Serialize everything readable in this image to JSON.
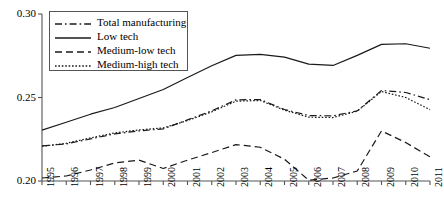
{
  "chart_data": {
    "type": "line",
    "title": "",
    "subtitle": "",
    "xlabel": "",
    "ylabel": "",
    "x": [
      1995,
      1996,
      1997,
      1998,
      1999,
      2000,
      2001,
      2002,
      2003,
      2004,
      2005,
      2006,
      2007,
      2008,
      2009,
      2010,
      2011
    ],
    "categories": [
      "1995",
      "1996",
      "1997",
      "1998",
      "1999",
      "2000",
      "2001",
      "2002",
      "2003",
      "2004",
      "2005",
      "2006",
      "2007",
      "2008",
      "2009",
      "2010",
      "2011"
    ],
    "xlim": [
      1995,
      2011
    ],
    "ylim": [
      0.2,
      0.3
    ],
    "yticks": [
      0.2,
      0.25,
      0.3
    ],
    "ytick_labels": [
      "0.20",
      "0.25",
      "0.30"
    ],
    "grid": false,
    "legend_position": "upper-left",
    "series": [
      {
        "name": "Total manufacturing",
        "style": "dash-dot",
        "color": "#1a1a1a",
        "values": [
          0.221,
          0.2222,
          0.2252,
          0.2282,
          0.23,
          0.2312,
          0.2366,
          0.242,
          0.2486,
          0.2488,
          0.2428,
          0.2392,
          0.239,
          0.242,
          0.2542,
          0.253,
          0.2487
        ]
      },
      {
        "name": "Low tech",
        "style": "solid",
        "color": "#1a1a1a",
        "values": [
          0.2305,
          0.2352,
          0.24,
          0.244,
          0.2494,
          0.2548,
          0.262,
          0.269,
          0.2752,
          0.2758,
          0.2742,
          0.27,
          0.2692,
          0.2752,
          0.2818,
          0.2822,
          0.2795
        ]
      },
      {
        "name": "Medium-low tech",
        "style": "dashed",
        "color": "#1a1a1a",
        "values": [
          0.2018,
          0.203,
          0.2066,
          0.2108,
          0.2125,
          0.2075,
          0.2125,
          0.217,
          0.2218,
          0.2202,
          0.213,
          0.2005,
          0.2018,
          0.206,
          0.23,
          0.223,
          0.2145
        ]
      },
      {
        "name": "Medium-high tech",
        "style": "dotted",
        "color": "#1a1a1a",
        "values": [
          0.2208,
          0.2226,
          0.2258,
          0.2288,
          0.2306,
          0.2318,
          0.2362,
          0.2414,
          0.2478,
          0.2482,
          0.2424,
          0.2382,
          0.238,
          0.2418,
          0.2536,
          0.25,
          0.2427
        ]
      }
    ]
  },
  "axes": {
    "y_labels": [
      "0.30",
      "0.25",
      "0.20"
    ],
    "x_labels": [
      "1995",
      "1996",
      "1997",
      "1998",
      "1999",
      "2000",
      "2001",
      "2002",
      "2003",
      "2004",
      "2005",
      "2006",
      "2007",
      "2008",
      "2009",
      "2010",
      "2011"
    ]
  },
  "legend": {
    "items": [
      {
        "label": "Total manufacturing",
        "style": "dash-dot"
      },
      {
        "label": "Low tech",
        "style": "solid"
      },
      {
        "label": "Medium-low tech",
        "style": "dashed"
      },
      {
        "label": "Medium-high tech",
        "style": "dotted"
      }
    ]
  }
}
